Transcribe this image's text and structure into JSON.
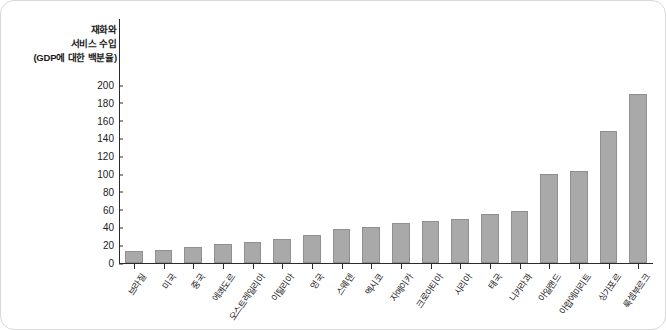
{
  "chart_data": {
    "type": "bar",
    "title": "",
    "ylabel_lines": [
      "재화와",
      "서비스 수입",
      "(GDP에 대한 백분율)"
    ],
    "ylabel": "재화와 서비스 수입 (GDP에 대한 백분율)",
    "xlabel": "",
    "ylim": [
      0,
      200
    ],
    "ytick_labels": [
      "0",
      "20",
      "40",
      "60",
      "80",
      "100",
      "120",
      "140",
      "160",
      "180",
      "200"
    ],
    "ytick_values": [
      0,
      20,
      40,
      60,
      80,
      100,
      120,
      140,
      160,
      180,
      200
    ],
    "grid": false,
    "legend": "none",
    "bar_color": "#a9a9a9",
    "bar_edge_color": "#8f8f8f",
    "categories": [
      "브라질",
      "미국",
      "중국",
      "에콰도르",
      "오스트레일리아",
      "이탈리아",
      "영국",
      "스웨덴",
      "멕시코",
      "자메이카",
      "크로아티아",
      "시리아",
      "태국",
      "니카라과",
      "아일랜드",
      "아랍에미리트",
      "싱가포르",
      "룩셈부르크"
    ],
    "values": [
      13,
      15,
      18,
      21,
      24,
      27,
      32,
      38,
      40,
      45,
      47,
      50,
      55,
      59,
      100,
      103,
      148,
      190
    ]
  }
}
